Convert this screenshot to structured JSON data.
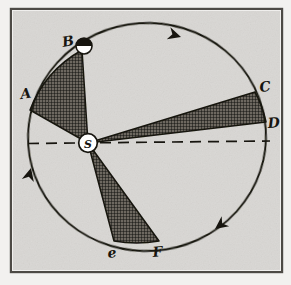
{
  "figure": {
    "frame": {
      "x": 11,
      "y": 9,
      "width": 271,
      "height": 263,
      "border_color": "#4d4a45"
    },
    "background_color": "#d9d7d4",
    "paper_color": "#f2f1ef",
    "ink_color": "#17150f",
    "hatch_color": "#4a463f",
    "orbit": {
      "name": "elliptical-orbit",
      "center_x": 147,
      "center_y": 137,
      "radius_x": 119,
      "radius_y": 114,
      "rotation_deg": -4,
      "stroke_width": 1.8
    },
    "sun": {
      "label": "S",
      "x": 88,
      "y": 143,
      "radius": 9.5,
      "fill": "#ffffff"
    },
    "planet": {
      "name": "planet-marker",
      "x": 84,
      "y": 46,
      "radius": 8,
      "top_fill": "#17150f",
      "bottom_fill": "#ffffff"
    },
    "major_axis": {
      "name": "major-axis-dashed-line",
      "x1": 28,
      "y1": 143,
      "x2": 270,
      "y2": 141,
      "dash": "11 7"
    },
    "points": [
      {
        "id": "A",
        "label": "A",
        "px": 30,
        "py": 110,
        "lx": 21,
        "ly": 99
      },
      {
        "id": "B",
        "label": "B",
        "px": 82,
        "py": 52,
        "lx": 65,
        "ly": 46
      },
      {
        "id": "C",
        "label": "C",
        "px": 255,
        "py": 93,
        "lx": 262,
        "ly": 90
      },
      {
        "id": "D",
        "label": "D",
        "px": 265,
        "py": 122,
        "lx": 271,
        "ly": 127
      },
      {
        "id": "E",
        "label": "e",
        "px": 115,
        "py": 240,
        "lx": 110,
        "ly": 257
      },
      {
        "id": "F",
        "label": "F",
        "px": 158,
        "py": 241,
        "lx": 155,
        "ly": 257
      }
    ],
    "sectors": [
      {
        "id": "ASB",
        "name": "sector-a-s-b",
        "from": "A",
        "to": "B",
        "label": "equal area sector A-S-B"
      },
      {
        "id": "CSD",
        "name": "sector-c-s-d",
        "from": "C",
        "to": "D",
        "label": "equal area sector C-S-D"
      },
      {
        "id": "ESF",
        "name": "sector-e-s-f",
        "from": "E",
        "to": "F",
        "label": "equal area sector E-S-F"
      }
    ],
    "direction_arrows": [
      {
        "name": "orbit-arrow-top",
        "x": 181,
        "y": 37,
        "angle": 198
      },
      {
        "name": "orbit-arrow-left",
        "x": 31,
        "y": 168,
        "angle": 104
      },
      {
        "name": "orbit-arrow-bottom-right",
        "x": 216,
        "y": 228,
        "angle": -36
      }
    ]
  }
}
